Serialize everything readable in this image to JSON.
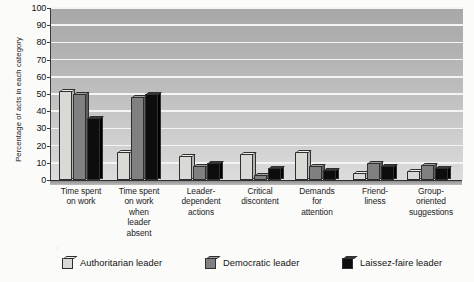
{
  "chart_data": {
    "type": "bar",
    "title": "",
    "xlabel": "",
    "ylabel": "Percentage of acts in each category",
    "ylim": [
      0,
      100
    ],
    "yticks": [
      0,
      10,
      20,
      30,
      40,
      50,
      60,
      70,
      80,
      90,
      100
    ],
    "grid": true,
    "legend_position": "bottom",
    "categories": [
      "Time spent on work",
      "Time spent on work when leader absent",
      "Leader-dependent actions",
      "Critical discontent",
      "Demands for attention",
      "Friend-liness",
      "Group-oriented suggestions"
    ],
    "category_lines": [
      [
        "Time spent",
        "on work"
      ],
      [
        "Time spent",
        "on work",
        "when",
        "leader",
        "absent"
      ],
      [
        "Leader-",
        "dependent",
        "actions"
      ],
      [
        "Critical",
        "discontent"
      ],
      [
        "Demands",
        "for",
        "attention"
      ],
      [
        "Friend-",
        "liness"
      ],
      [
        "Group-",
        "oriented",
        "suggestions"
      ]
    ],
    "series": [
      {
        "name": "Authoritarian leader",
        "color": "#d9d9d6",
        "values": [
          52,
          16,
          14,
          15,
          16,
          4,
          5
        ]
      },
      {
        "name": "Democratic leader",
        "color": "#808080",
        "values": [
          50,
          48,
          8,
          3,
          8,
          10,
          9
        ]
      },
      {
        "name": "Laissez-faire leader",
        "color": "#0d0d0d",
        "values": [
          36,
          50,
          10,
          7,
          6,
          8,
          7
        ]
      }
    ]
  }
}
